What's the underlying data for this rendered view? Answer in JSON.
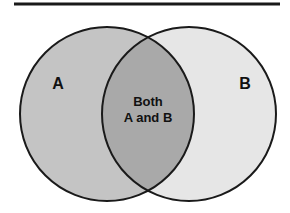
{
  "diagram": {
    "type": "venn",
    "sets": [
      {
        "id": "A",
        "label": "A",
        "fill": "#c4c4c4"
      },
      {
        "id": "B",
        "label": "B",
        "fill": "#e6e6e6"
      }
    ],
    "intersection": {
      "label_line1": "Both",
      "label_line2": "A and B",
      "fill": "#a9a9a9"
    },
    "stroke_color": "#1a1a1a",
    "rule_color": "#1a1a1a"
  }
}
